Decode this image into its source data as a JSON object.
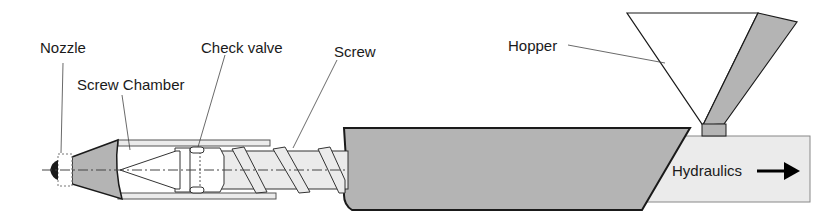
{
  "diagram": {
    "labels": {
      "nozzle": "Nozzle",
      "screw_chamber": "Screw Chamber",
      "check_valve": "Check valve",
      "screw": "Screw",
      "hopper": "Hopper",
      "hydraulics": "Hydraulics"
    },
    "colors": {
      "fill_gray": "#b4b4b4",
      "fill_light": "#ebebeb",
      "stroke": "#1a1a1a"
    }
  }
}
